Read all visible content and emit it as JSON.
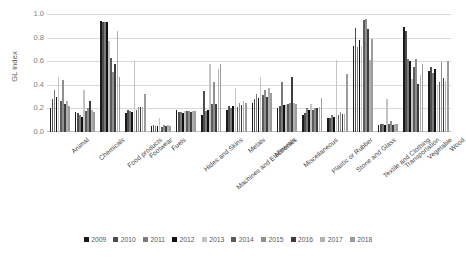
{
  "chart_data": {
    "type": "bar",
    "title": "",
    "xlabel": "",
    "ylabel": "GL index",
    "ylim": [
      0,
      1.0
    ],
    "yticks": [
      "0.0",
      "0.2",
      "0.4",
      "0.6",
      "0.8",
      "1.0"
    ],
    "grid": true,
    "legend_position": "bottom",
    "categories": [
      "Animal",
      "Chemicals",
      "Food products",
      "Footwear",
      "Fuels",
      "Hides and Skins",
      "Machines and Electronics",
      "Metals",
      "Minerals",
      "Miscellaneous",
      "Plastic or Rubber",
      "Stone and Glass",
      "Textile and Clothing",
      "Transportation",
      "Vegetable",
      "Wood"
    ],
    "series": [
      {
        "name": "2009",
        "color": "#1a1a1a",
        "values": [
          0.2,
          0.17,
          0.94,
          0.16,
          0.05,
          0.19,
          0.14,
          0.19,
          0.25,
          0.2,
          0.14,
          0.12,
          0.73,
          0.06,
          0.89,
          0.52
        ]
      },
      {
        "name": "2010",
        "color": "#4d4d4d",
        "values": [
          0.28,
          0.16,
          0.93,
          0.19,
          0.06,
          0.17,
          0.35,
          0.22,
          0.28,
          0.22,
          0.16,
          0.12,
          0.88,
          0.07,
          0.86,
          0.55
        ]
      },
      {
        "name": "2011",
        "color": "#7a7a7a",
        "values": [
          0.36,
          0.14,
          0.93,
          0.18,
          0.05,
          0.17,
          0.18,
          0.2,
          0.32,
          0.42,
          0.2,
          0.14,
          0.72,
          0.07,
          0.62,
          0.5
        ]
      },
      {
        "name": "2012",
        "color": "#111111",
        "values": [
          0.3,
          0.13,
          0.93,
          0.17,
          0.05,
          0.16,
          0.19,
          0.22,
          0.29,
          0.23,
          0.19,
          0.13,
          0.78,
          0.06,
          0.6,
          0.53
        ]
      },
      {
        "name": "2013",
        "color": "#c4c4c4",
        "values": [
          0.47,
          0.36,
          0.77,
          0.6,
          0.12,
          0.18,
          0.58,
          0.37,
          0.47,
          0.23,
          0.24,
          0.61,
          0.73,
          0.28,
          0.45,
          0.4
        ]
      },
      {
        "name": "2014",
        "color": "#5c5c5c",
        "values": [
          0.26,
          0.18,
          0.63,
          0.19,
          0.04,
          0.18,
          0.24,
          0.21,
          0.31,
          0.24,
          0.19,
          0.14,
          0.95,
          0.07,
          0.55,
          0.42
        ]
      },
      {
        "name": "2015",
        "color": "#8f8f8f",
        "values": [
          0.44,
          0.2,
          0.51,
          0.21,
          0.06,
          0.18,
          0.42,
          0.25,
          0.36,
          0.25,
          0.2,
          0.17,
          0.96,
          0.09,
          0.62,
          0.59
        ]
      },
      {
        "name": "2016",
        "color": "#3d3d3d",
        "values": [
          0.24,
          0.26,
          0.58,
          0.21,
          0.05,
          0.17,
          0.24,
          0.23,
          0.3,
          0.47,
          0.2,
          0.15,
          0.87,
          0.06,
          0.41,
          0.46
        ]
      },
      {
        "name": "2017",
        "color": "#b0b0b0",
        "values": [
          0.26,
          0.19,
          0.86,
          0.21,
          0.06,
          0.18,
          0.53,
          0.26,
          0.37,
          0.25,
          0.21,
          0.15,
          0.61,
          0.07,
          0.48,
          0.43
        ]
      },
      {
        "name": "2018",
        "color": "#9c9c9c",
        "values": [
          0.22,
          0.17,
          0.47,
          0.32,
          0.05,
          0.18,
          0.58,
          0.25,
          0.33,
          0.24,
          0.29,
          0.49,
          0.79,
          0.07,
          0.58,
          0.6
        ]
      }
    ]
  }
}
